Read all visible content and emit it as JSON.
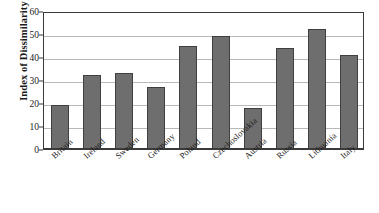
{
  "chart_data": {
    "type": "bar",
    "title": "",
    "xlabel": "",
    "ylabel": "Index of Dissimilarity",
    "ylim": [
      0,
      60
    ],
    "ytick_step": 10,
    "yticks": [
      0,
      10,
      20,
      30,
      40,
      50,
      60
    ],
    "grid": "horizontal",
    "legend": "none",
    "categories": [
      "Britain",
      "Ireland",
      "Sweden",
      "Germany",
      "Poland",
      "Czechoslovakia",
      "Austria",
      "Russia",
      "Lithuania",
      "Italy"
    ],
    "values": [
      19,
      32,
      33,
      27,
      45,
      49,
      18,
      44,
      52,
      41
    ],
    "bar_color": "#6e6e6e",
    "bar_edge_color": "#3f3f3f",
    "gridline_color": "#b9b9b9",
    "axis_color": "#3a3a3a",
    "background_color": "#ffffff"
  }
}
